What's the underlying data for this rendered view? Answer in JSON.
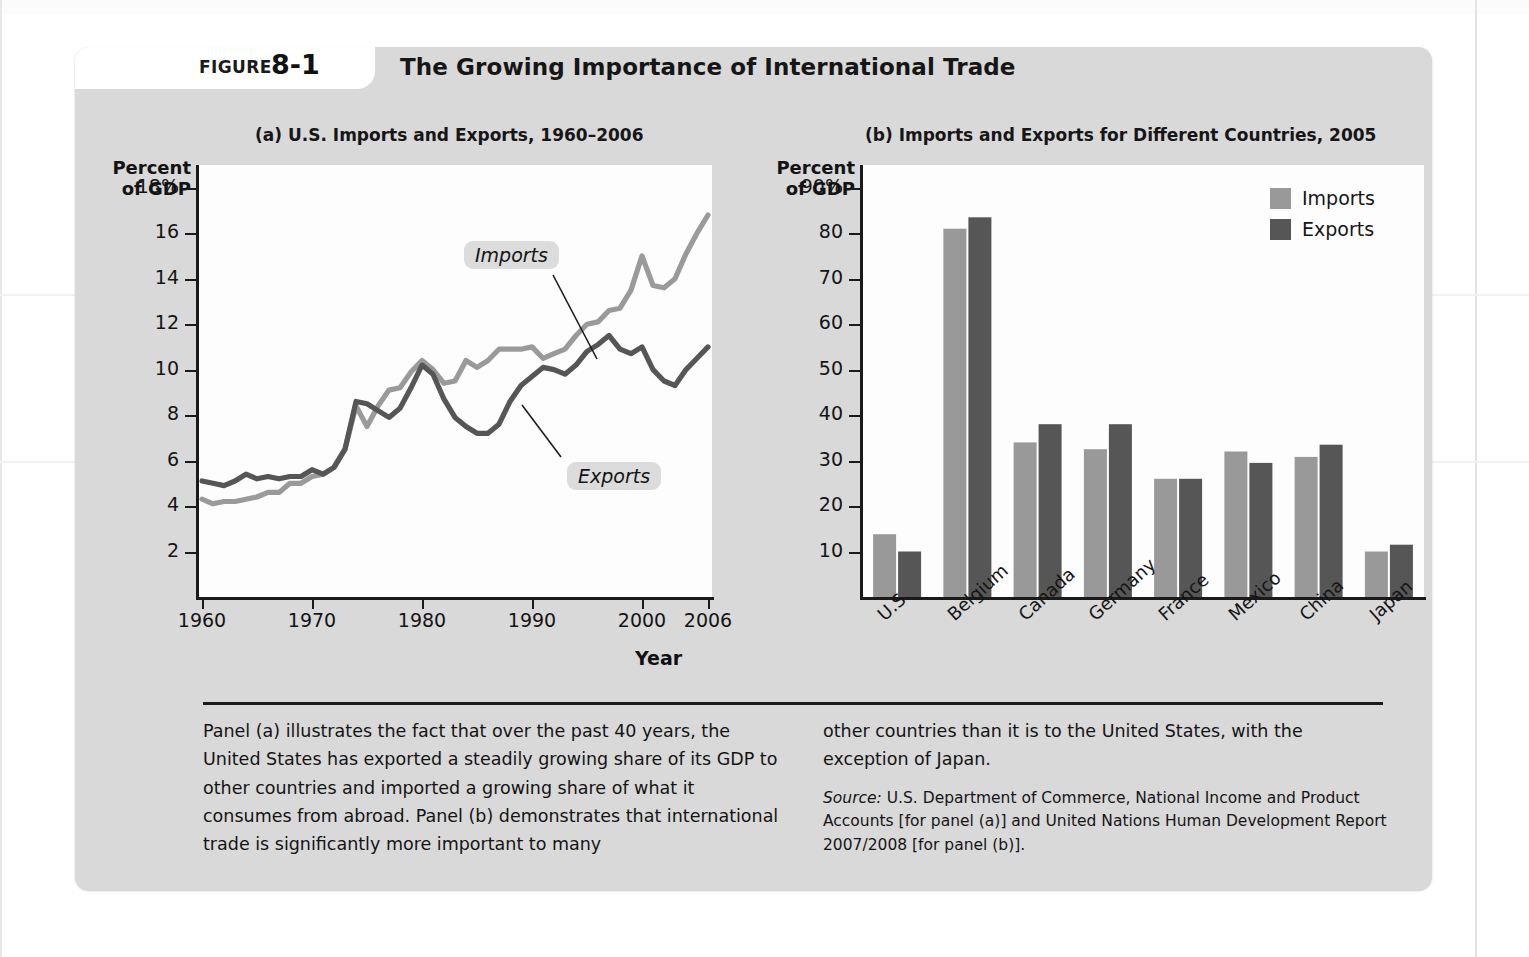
{
  "figure": {
    "label": "FIGURE",
    "number": "8-1",
    "title": "The Growing Importance of International Trade"
  },
  "panel_a": {
    "title": "(a) U.S. Imports and Exports, 1960–2006",
    "axis_caption": "Percent\nof GDP",
    "x_axis_name": "Year",
    "callout_imports": "Imports",
    "callout_exports": "Exports"
  },
  "panel_b": {
    "title": "(b) Imports and Exports for Different Countries, 2005",
    "axis_caption": "Percent\nof GDP",
    "legend": [
      {
        "label": "Imports",
        "color": "#999999"
      },
      {
        "label": "Exports",
        "color": "#565656"
      }
    ]
  },
  "caption": {
    "left": "Panel (a) illustrates the fact that over the past 40 years, the United States has exported a steadily growing share of its GDP to other countries and imported a growing share of what it consumes from abroad. Panel (b) demonstrates that international trade is significantly more important to many",
    "right": "other countries than it is to the United States, with the exception of Japan.",
    "source_word": "Source:",
    "source_body": " U.S. Department of Commerce, National Income and Product Accounts [for panel (a)] and United Nations Human Development Report 2007/2008 [for panel (b)]."
  },
  "colors": {
    "imports": "#9a9a9a",
    "exports": "#565656",
    "figure_bg": "#d9d9d9",
    "plot_bg": "#fdfdfd",
    "axis": "#1a1a1a"
  },
  "chart_data": [
    {
      "type": "line",
      "title": "(a) U.S. Imports and Exports, 1960–2006",
      "xlabel": "Year",
      "ylabel": "Percent of GDP",
      "xlim": [
        1960,
        2006
      ],
      "ylim": [
        0,
        19
      ],
      "yticks": [
        2,
        4,
        6,
        8,
        10,
        12,
        14,
        16,
        18
      ],
      "ytick_labels": [
        "2",
        "4",
        "6",
        "8",
        "10",
        "12",
        "14",
        "16",
        "18%"
      ],
      "xticks": [
        1960,
        1970,
        1980,
        1990,
        2000,
        2006
      ],
      "xtick_labels": [
        "1960",
        "1970",
        "1980",
        "1990",
        "2000",
        "2006"
      ],
      "grid": false,
      "legend_position": "inline-callouts",
      "annotations": [
        "Imports",
        "Exports"
      ],
      "x": [
        1960,
        1961,
        1962,
        1963,
        1964,
        1965,
        1966,
        1967,
        1968,
        1969,
        1970,
        1971,
        1972,
        1973,
        1974,
        1975,
        1976,
        1977,
        1978,
        1979,
        1980,
        1981,
        1982,
        1983,
        1984,
        1985,
        1986,
        1987,
        1988,
        1989,
        1990,
        1991,
        1992,
        1993,
        1994,
        1995,
        1996,
        1997,
        1998,
        1999,
        2000,
        2001,
        2002,
        2003,
        2004,
        2005,
        2006
      ],
      "series": [
        {
          "name": "Imports",
          "color": "#9a9a9a",
          "values": [
            4.3,
            4.1,
            4.2,
            4.2,
            4.3,
            4.4,
            4.6,
            4.6,
            5.0,
            5.0,
            5.3,
            5.4,
            5.7,
            6.5,
            8.4,
            7.5,
            8.4,
            9.1,
            9.2,
            9.9,
            10.4,
            10.0,
            9.4,
            9.5,
            10.4,
            10.1,
            10.4,
            10.9,
            10.9,
            10.9,
            11.0,
            10.5,
            10.7,
            10.9,
            11.5,
            12.0,
            12.1,
            12.6,
            12.7,
            13.5,
            15.0,
            13.7,
            13.6,
            14.0,
            15.1,
            16.0,
            16.8
          ]
        },
        {
          "name": "Exports",
          "color": "#565656",
          "values": [
            5.1,
            5.0,
            4.9,
            5.1,
            5.4,
            5.2,
            5.3,
            5.2,
            5.3,
            5.3,
            5.6,
            5.4,
            5.7,
            6.5,
            8.6,
            8.5,
            8.2,
            7.9,
            8.3,
            9.2,
            10.2,
            9.8,
            8.7,
            7.9,
            7.5,
            7.2,
            7.2,
            7.6,
            8.6,
            9.3,
            9.7,
            10.1,
            10.0,
            9.8,
            10.2,
            10.8,
            11.1,
            11.5,
            10.9,
            10.7,
            11.0,
            10.0,
            9.5,
            9.3,
            10.0,
            10.5,
            11.0
          ]
        }
      ]
    },
    {
      "type": "bar",
      "title": "(b) Imports and Exports for Different Countries, 2005",
      "xlabel": "",
      "ylabel": "Percent of GDP",
      "ylim": [
        0,
        95
      ],
      "yticks": [
        10,
        20,
        30,
        40,
        50,
        60,
        70,
        80,
        90
      ],
      "ytick_labels": [
        "10",
        "20",
        "30",
        "40",
        "50",
        "60",
        "70",
        "80",
        "90%"
      ],
      "grid": false,
      "legend_position": "top-right",
      "categories": [
        "U.S.",
        "Belgium",
        "Canada",
        "Germany",
        "France",
        "Mexico",
        "China",
        "Japan"
      ],
      "series": [
        {
          "name": "Imports",
          "color": "#999999",
          "values": [
            13.8,
            81.0,
            34.0,
            32.5,
            26.0,
            32.0,
            30.8,
            10.0
          ]
        },
        {
          "name": "Exports",
          "color": "#565656",
          "values": [
            10.0,
            83.5,
            38.0,
            38.0,
            26.0,
            29.5,
            33.5,
            11.5
          ]
        }
      ]
    }
  ]
}
